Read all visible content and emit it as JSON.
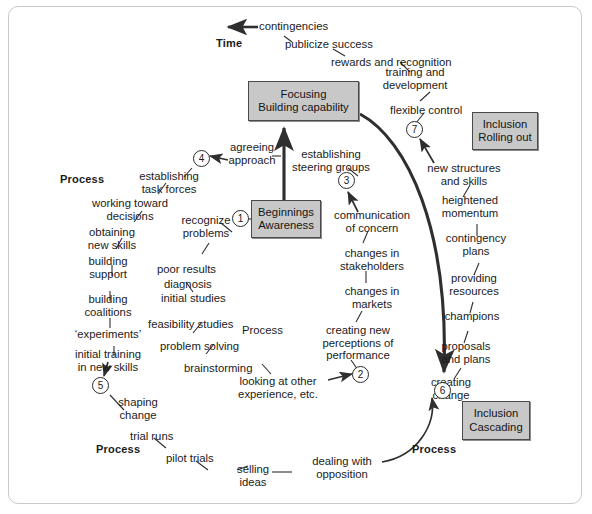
{
  "diagram": {
    "title_label": "Time",
    "process_labels": [
      {
        "id": "process-top-left",
        "text": "Process"
      },
      {
        "id": "process-center",
        "text": "Process"
      },
      {
        "id": "process-bottom-left",
        "text": "Process"
      },
      {
        "id": "process-bottom-right",
        "text": "Process"
      }
    ],
    "boxes": [
      {
        "id": "focusing",
        "line1": "Focusing",
        "line2": "Building capability"
      },
      {
        "id": "beginnings",
        "line1": "Beginnings",
        "line2": "Awareness"
      },
      {
        "id": "inclusion-rolling-out",
        "line1": "Inclusion",
        "line2": "Rolling out"
      },
      {
        "id": "inclusion-cascading",
        "line1": "Inclusion",
        "line2": "Cascading"
      }
    ],
    "nodes": [
      {
        "id": "node-1",
        "label": "1"
      },
      {
        "id": "node-2",
        "label": "2"
      },
      {
        "id": "node-3",
        "label": "3"
      },
      {
        "id": "node-4",
        "label": "4"
      },
      {
        "id": "node-5",
        "label": "5"
      },
      {
        "id": "node-6",
        "label": "6"
      },
      {
        "id": "node-7",
        "label": "7"
      }
    ],
    "items": {
      "contingencies": "contingencies",
      "publicize_success": "publicize success",
      "rewards_and_recognition": "rewards and recognition",
      "training_and_development": "training and\ndevelopment",
      "flexible_control": "flexible control",
      "new_structures_and_skills": "new structures\nand skills",
      "heightened_momentum": "heightened\nmomentum",
      "contingency_plans": "contingency\nplans",
      "providing_resources": "providing\nresources",
      "champions": "champions",
      "proposals_and_plans": "proposals\nand plans",
      "creating_change": "creating\nchange",
      "dealing_with_opposition": "dealing with\nopposition",
      "selling_ideas": "selling\nideas",
      "pilot_trials": "pilot trials",
      "trial_runs": "trial runs",
      "shaping_change": "shaping\nchange",
      "initial_training_in_new_skills": "initial training\nin new skills",
      "experiments": "‘experiments’",
      "building_coalitions": "building\ncoalitions",
      "building_support": "building\nsupport",
      "obtaining_new_skills": "obtaining\nnew skills",
      "working_toward_decisions": "working toward\ndecisions",
      "establishing_task_forces": "establishing\ntask forces",
      "agreeing_approach": "agreeing\napproach",
      "establishing_steering_groups": "establishing\nsteering groups",
      "recognize_problems": "recognize\nproblems",
      "poor_results": "poor results",
      "diagnosis": "diagnosis",
      "initial_studies": "initial studies",
      "feasibility_studies": "feasibility studies",
      "problem_solving": "problem solving",
      "brainstorming": "brainstorming",
      "looking_at_other_experience": "looking at other\nexperience, etc.",
      "communication_of_concern": "communication\nof concern",
      "changes_in_stakeholders": "changes in\nstakeholders",
      "changes_in_markets": "changes in\nmarkets",
      "creating_new_perceptions": "creating new\nperceptions of\nperformance"
    },
    "colors": {
      "box_fill": "#c8c8c8",
      "box_border": "#4a4a4a",
      "line": "#2f2f2f",
      "frame": "#c9c9c9",
      "text": "#1b1b1b"
    }
  }
}
